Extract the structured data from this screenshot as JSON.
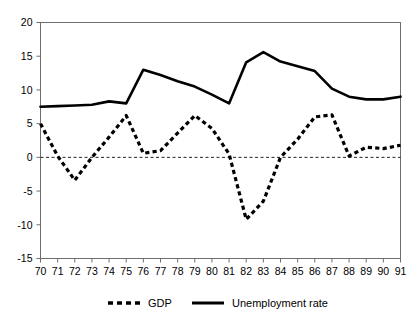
{
  "chart_data": {
    "type": "line",
    "title": "",
    "xlabel": "",
    "ylabel": "",
    "x": [
      70,
      71,
      72,
      73,
      74,
      75,
      76,
      77,
      78,
      79,
      80,
      81,
      82,
      83,
      84,
      85,
      86,
      87,
      88,
      89,
      90,
      91
    ],
    "xtick_labels": [
      "70",
      "71",
      "72",
      "73",
      "74",
      "75",
      "76",
      "77",
      "78",
      "79",
      "80",
      "81",
      "82",
      "83",
      "84",
      "85",
      "86",
      "87",
      "88",
      "89",
      "90",
      "91"
    ],
    "ytick_labels": [
      "-15",
      "-10",
      "-5",
      "0",
      "5",
      "10",
      "15",
      "20"
    ],
    "yticks": [
      -15,
      -10,
      -5,
      0,
      5,
      10,
      15,
      20
    ],
    "ylim": [
      -15,
      20
    ],
    "xlim": [
      70,
      91
    ],
    "grid": false,
    "zero_line": true,
    "legend_position": "bottom",
    "series": [
      {
        "name": "GDP",
        "style": "dashed",
        "color": "#000000",
        "values": [
          5.0,
          0.2,
          -3.4,
          0.0,
          3.0,
          6.2,
          0.6,
          1.0,
          3.6,
          6.2,
          4.3,
          0.5,
          -9.2,
          -6.5,
          0.0,
          2.7,
          6.0,
          6.3,
          0.2,
          1.5,
          1.3,
          1.8
        ]
      },
      {
        "name": "Unemployment rate",
        "style": "solid",
        "color": "#000000",
        "values": [
          7.5,
          7.6,
          7.7,
          7.8,
          8.3,
          8.0,
          13.0,
          12.2,
          11.3,
          10.5,
          9.3,
          8.0,
          14.1,
          15.6,
          14.2,
          13.5,
          12.8,
          10.2,
          9.0,
          8.6,
          8.6,
          9.0
        ]
      }
    ]
  },
  "legend": {
    "items": [
      {
        "label": "GDP",
        "style": "dashed"
      },
      {
        "label": "Unemployment rate",
        "style": "solid"
      }
    ]
  }
}
